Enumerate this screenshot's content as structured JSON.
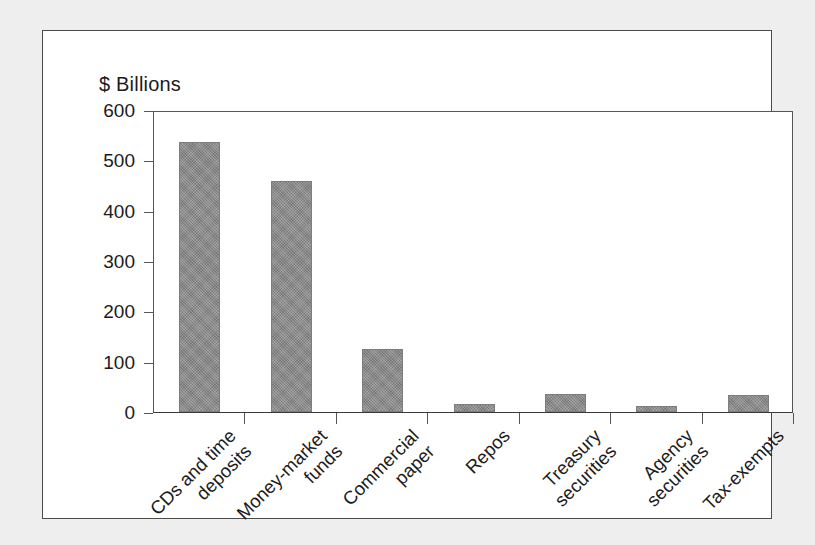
{
  "figure": {
    "axis_title": "$ Billions",
    "background_color": "#ffffff",
    "page_background_color": "#eeeeee",
    "frame_color": "#4a4a4a",
    "bar_color": "#868686"
  },
  "chart_data": {
    "type": "bar",
    "title": "",
    "subtitle": "",
    "xlabel": "",
    "ylabel": "$ Billions",
    "ylim": [
      0,
      600
    ],
    "yticks": [
      0,
      100,
      200,
      300,
      400,
      500,
      600
    ],
    "ytick_labels": [
      "0",
      "100",
      "200",
      "300",
      "400",
      "500",
      "600"
    ],
    "grid": false,
    "legend": null,
    "categories": [
      "CDs and time deposits",
      "Money-market funds",
      "Commercial paper",
      "Repos",
      "Treasury securities",
      "Agency securities",
      "Tax-exempts"
    ],
    "category_lines": [
      [
        "CDs and time",
        "deposits"
      ],
      [
        "Money-market",
        "funds"
      ],
      [
        "Commercial",
        "paper"
      ],
      [
        "Repos",
        ""
      ],
      [
        "Treasury",
        "securities"
      ],
      [
        "Agency",
        "securities"
      ],
      [
        "Tax-exempts",
        ""
      ]
    ],
    "values": [
      537,
      458,
      126,
      16,
      35,
      12,
      33
    ],
    "series": [
      {
        "name": "",
        "values": [
          537,
          458,
          126,
          16,
          35,
          12,
          33
        ]
      }
    ]
  }
}
